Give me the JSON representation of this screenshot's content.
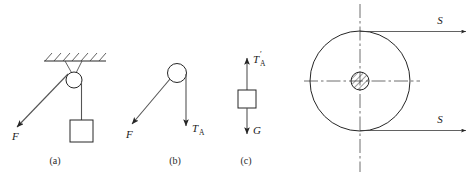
{
  "figure": {
    "background_color": "#ffffff",
    "line_color": "#262626",
    "panels": [
      {
        "id": "a",
        "caption": "(a)",
        "description": "Pulley attached to hatched ceiling with rope pulled by force F and block suspended",
        "elements": {
          "ceiling_label": "hatched-ceiling",
          "pulley_label": "pulley",
          "block_label": "block",
          "force_label": "F"
        }
      },
      {
        "id": "b",
        "caption": "(b)",
        "description": "Free body diagram of pulley showing force F and tension T_A",
        "elements": {
          "pulley_label": "pulley",
          "force_label": "F",
          "tension_label": "T",
          "tension_subscript": "A"
        }
      },
      {
        "id": "c",
        "caption": "(c)",
        "description": "Free body diagram of block showing tension T_A prime upward and weight G downward",
        "elements": {
          "block_label": "block",
          "tension_label": "T",
          "tension_subscript": "A",
          "tension_prime": "′",
          "weight_label": "G"
        }
      },
      {
        "id": "d",
        "caption": "",
        "description": "Large pulley wheel with dash-dot centerlines, hatched axle hub, and two tangential forces S",
        "elements": {
          "wheel_label": "pulley-wheel",
          "hub_label": "axle-hub",
          "force_top_label": "S",
          "force_bottom_label": "S",
          "vertical_centerline": "vertical-centerline",
          "horizontal_centerline": "horizontal-centerline"
        }
      }
    ],
    "labels": {
      "force_f_a": "F",
      "force_f_b": "F",
      "tension_t": "T",
      "tension_sub_a": "A",
      "prime_mark": "′",
      "weight_g": "G",
      "force_s_top": "S",
      "force_s_bottom": "S",
      "caption_a": "(a)",
      "caption_b": "(b)",
      "caption_c": "(c)"
    }
  }
}
